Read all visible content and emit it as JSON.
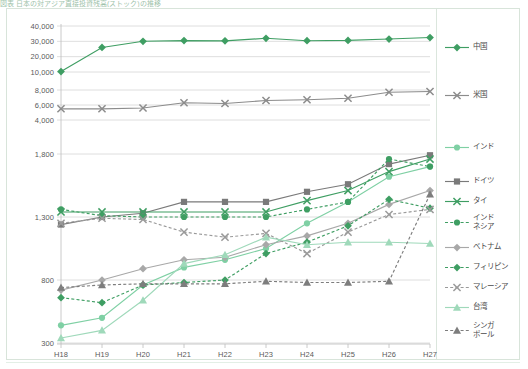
{
  "title": "図表 日本の対アジア直接投資残高(ストック)の推移",
  "axes": {
    "x_label": "",
    "y_label": "",
    "x_ticks": [
      "H18",
      "H19",
      "H20",
      "H21",
      "H22",
      "H23",
      "H24",
      "H25",
      "H26",
      "H27"
    ],
    "y_ticks_upper": [
      "40,000",
      "30,000",
      "20,000",
      "10,000"
    ],
    "y_ticks_mid": [
      "8,000",
      "6,000",
      "4,000"
    ],
    "y_ticks_lower": [
      "1,800",
      "1,300",
      "800",
      "300"
    ]
  },
  "colors": {
    "china": "#3f9e63",
    "usa": "#8c8c8c",
    "india": "#7fd0a4",
    "germany": "#7a7a7a",
    "thailand": "#3f9e63",
    "indonesia": "#3f9e63",
    "vietnam": "#a8a8a8",
    "philippines": "#3f9e63",
    "malaysia": "#9a9a9a",
    "taiwan": "#9fd9ba",
    "singapore": "#7d7d7d",
    "grid": "#d5d5d5",
    "frame": "#d8e4da"
  },
  "legend": {
    "items": [
      {
        "label": "中国",
        "key": "china",
        "marker": "diamond",
        "dash": false,
        "color": "#3f9e63"
      },
      {
        "label": "米国",
        "key": "usa",
        "marker": "x",
        "dash": false,
        "color": "#8c8c8c"
      },
      {
        "label": "インド",
        "key": "india",
        "marker": "circle",
        "dash": false,
        "color": "#7fd0a4"
      },
      {
        "label": "ドイツ",
        "key": "germany",
        "marker": "square",
        "dash": false,
        "color": "#7a7a7a"
      },
      {
        "label": "タイ",
        "key": "thailand",
        "marker": "x",
        "dash": false,
        "color": "#3f9e63"
      },
      {
        "label": "インド\nネシア",
        "key": "indonesia",
        "marker": "circle",
        "dash": true,
        "color": "#3f9e63"
      },
      {
        "label": "ベトナム",
        "key": "vietnam",
        "marker": "diamond",
        "dash": false,
        "color": "#a8a8a8"
      },
      {
        "label": "フィリピン",
        "key": "philippines",
        "marker": "diamond",
        "dash": true,
        "color": "#3f9e63"
      },
      {
        "label": "マレーシア",
        "key": "malaysia",
        "marker": "x",
        "dash": true,
        "color": "#9a9a9a"
      },
      {
        "label": "台湾",
        "key": "taiwan",
        "marker": "triangle",
        "dash": false,
        "color": "#9fd9ba"
      },
      {
        "label": "シンガ\nポール",
        "key": "singapore",
        "marker": "triangle",
        "dash": true,
        "color": "#7d7d7d"
      }
    ]
  },
  "chart_data": {
    "type": "line",
    "title": "図表 日本の対アジア直接投資残高(ストック)の推移",
    "xlabel": "",
    "ylabel": "",
    "x": [
      "H18",
      "H19",
      "H20",
      "H21",
      "H22",
      "H23",
      "H24",
      "H25",
      "H26",
      "H27"
    ],
    "y_axis_note": "broken axis: three panels — 10,000–40,000 / 4,000–8,000 / 300–1,800",
    "ylim_upper": [
      10000,
      40000
    ],
    "ylim_mid": [
      4000,
      8000
    ],
    "ylim_lower": [
      300,
      1800
    ],
    "grid": true,
    "legend_position": "right",
    "series": [
      {
        "name": "中国",
        "panel": "upper",
        "values": [
          10300,
          26000,
          30000,
          30500,
          30300,
          32000,
          30400,
          30600,
          31500,
          32500
        ]
      },
      {
        "name": "米国",
        "panel": "mid",
        "values": [
          5500,
          5500,
          5600,
          6300,
          6200,
          6600,
          6700,
          6900,
          7700,
          7800
        ]
      },
      {
        "name": "インド",
        "panel": "lower",
        "values": [
          440,
          500,
          760,
          900,
          960,
          1050,
          1250,
          1420,
          1620,
          1700
        ]
      },
      {
        "name": "ドイツ",
        "panel": "lower",
        "values": [
          1240,
          1300,
          1330,
          1420,
          1420,
          1420,
          1500,
          1560,
          1720,
          1790
        ]
      },
      {
        "name": "タイ",
        "panel": "lower",
        "values": [
          1340,
          1340,
          1340,
          1340,
          1340,
          1340,
          1430,
          1510,
          1660,
          1760
        ]
      },
      {
        "name": "インドネシア",
        "panel": "lower",
        "values": [
          1360,
          1310,
          1300,
          1300,
          1300,
          1300,
          1360,
          1420,
          1760,
          1700
        ]
      },
      {
        "name": "ベトナム",
        "panel": "lower",
        "values": [
          720,
          800,
          890,
          960,
          980,
          1080,
          1150,
          1250,
          1400,
          1510
        ]
      },
      {
        "name": "フィリピン",
        "panel": "lower",
        "values": [
          660,
          620,
          760,
          780,
          800,
          1010,
          1100,
          1230,
          1440,
          1370
        ]
      },
      {
        "name": "マレーシア",
        "panel": "lower",
        "values": [
          1250,
          1290,
          1280,
          1180,
          1140,
          1170,
          1010,
          1180,
          1320,
          1360
        ]
      },
      {
        "name": "台湾",
        "panel": "lower",
        "values": [
          340,
          400,
          640,
          930,
          1000,
          1140,
          1080,
          1100,
          1100,
          1090
        ]
      },
      {
        "name": "シンガポール",
        "panel": "lower",
        "values": [
          740,
          760,
          770,
          770,
          770,
          790,
          780,
          780,
          790,
          1480
        ]
      }
    ]
  }
}
